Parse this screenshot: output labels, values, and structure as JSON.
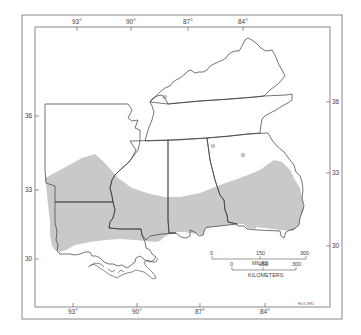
{
  "map": {
    "colors": {
      "background": "#ffffff",
      "frame": "#6b6b6b",
      "state_border": "#3a3a3a",
      "shaded_region": "#c9c9c9",
      "outlier_dot": "#c4c4c4"
    },
    "top_longitude_labels": [
      "93°",
      "90°",
      "87°",
      "84°"
    ],
    "bottom_longitude_labels": [
      "93°",
      "90°",
      "87°",
      "84°"
    ],
    "left_latitude_labels": [
      "36",
      "33",
      "30"
    ],
    "right_latitude_labels": [
      "36",
      "33",
      "30"
    ],
    "states": [
      "Kentucky",
      "Tennessee",
      "Arkansas",
      "Louisiana",
      "Mississippi",
      "Alabama",
      "Georgia"
    ],
    "shaded_region": "Gulf Coastal Plain distribution area (southern portion of region)",
    "outlier_points": 3,
    "scale_bar": {
      "miles": {
        "ticks": [
          "0",
          "150",
          "300"
        ],
        "unit_label": "MILES"
      },
      "kilometers": {
        "ticks": [
          "0",
          "150",
          "300"
        ],
        "unit_label": "KILOMETERS"
      }
    },
    "credit": "HLG 1981"
  }
}
